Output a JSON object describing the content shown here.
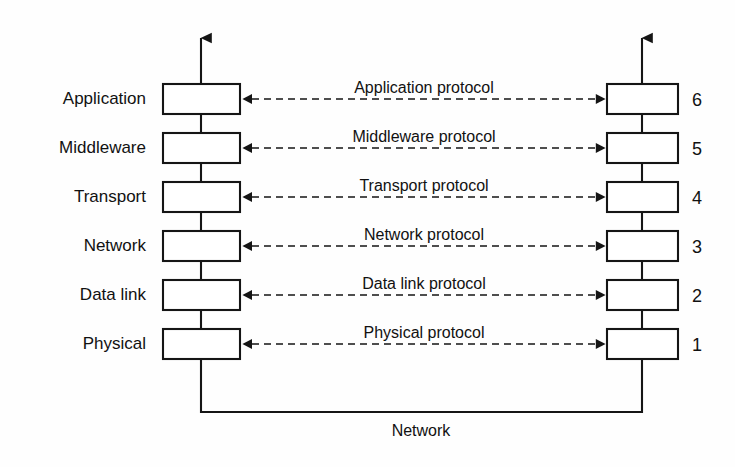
{
  "diagram": {
    "bottom_label": "Network",
    "left_stack_label": "left protocol stack",
    "right_stack_label": "right protocol stack",
    "colors": {
      "background": "#fefefe",
      "stroke": "#151515",
      "box_fill": "#ffffff",
      "text": "#111111"
    },
    "layers": [
      {
        "name": "Application",
        "number": "6",
        "protocol": "Application protocol"
      },
      {
        "name": "Middleware",
        "number": "5",
        "protocol": "Middleware protocol"
      },
      {
        "name": "Transport",
        "number": "4",
        "protocol": "Transport protocol"
      },
      {
        "name": "Network",
        "number": "3",
        "protocol": "Network protocol"
      },
      {
        "name": "Data link",
        "number": "2",
        "protocol": "Data link protocol"
      },
      {
        "name": "Physical",
        "number": "1",
        "protocol": "Physical protocol"
      }
    ]
  }
}
